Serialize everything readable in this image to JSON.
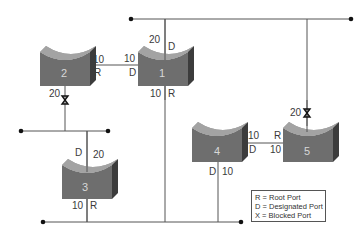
{
  "diagram": {
    "colors": {
      "line": "#555555",
      "switch_front": "#6e6e6e",
      "switch_top": "#9a9a9a",
      "switch_side": "#3c3c3c",
      "switch_label": "#d8d8d8"
    },
    "switches": [
      {
        "id": "1",
        "label": "1"
      },
      {
        "id": "2",
        "label": "2"
      },
      {
        "id": "3",
        "label": "3"
      },
      {
        "id": "4",
        "label": "4"
      },
      {
        "id": "5",
        "label": "5"
      }
    ],
    "port_labels": {
      "s1_top_cost": "20",
      "s1_top_role": "D",
      "s1_left_cost": "10",
      "s1_left_role": "D",
      "s1_bottom_cost": "10",
      "s1_bottom_role": "R",
      "s2_right_cost": "10",
      "s2_right_role": "R",
      "s2_bottom_cost": "20",
      "s3_top_role": "D",
      "s3_top_cost": "20",
      "s3_bottom_cost": "10",
      "s3_bottom_role": "R",
      "s4_right_cost": "10",
      "s4_right_role": "D",
      "s4_bottom_role": "D",
      "s4_bottom_cost": "10",
      "s5_left_role": "R",
      "s5_left_cost": "10",
      "s5_top_cost": "20"
    },
    "blocked_ports": [
      "switch 2 bottom",
      "switch 5 top"
    ],
    "legend": {
      "items": [
        "R = Root Port",
        "D = Designated Port",
        "X = Blocked Port"
      ]
    }
  }
}
